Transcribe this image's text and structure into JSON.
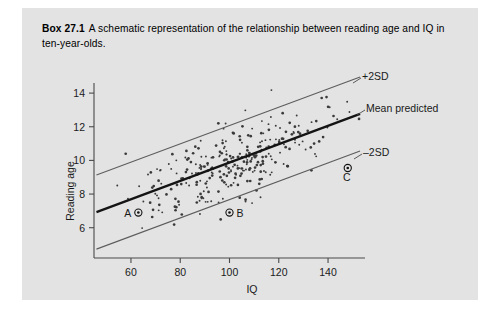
{
  "figure": {
    "box_label": "Box 27.1",
    "caption": "A schematic representation of the relationship between reading age and IQ in ten-year-olds.",
    "background_color": "#e3e3e3"
  },
  "chart_data": {
    "type": "scatter",
    "title": "",
    "xlabel": "IQ",
    "ylabel": "Reading age",
    "xlim": [
      45,
      155
    ],
    "ylim": [
      4.2,
      14.6
    ],
    "xticks": [
      60,
      80,
      100,
      120,
      140
    ],
    "yticks": [
      6,
      8,
      10,
      12,
      14
    ],
    "grid": false,
    "legend_position": "inline-right",
    "n_points": 300,
    "regression": {
      "slope": 0.0545,
      "intercept": 4.42,
      "sd": 1.1,
      "description": "mean predicted reading age = 4.42 + 0.0545 x IQ"
    },
    "lines": [
      {
        "name": "+2SD",
        "label": "+2SD",
        "offset_sd": 2,
        "style": "thin",
        "color": "#5d5d5d",
        "label_x": 362,
        "label_y": 80
      },
      {
        "name": "mean-predicted",
        "label": "Mean predicted",
        "offset_sd": 0,
        "style": "thick",
        "color": "#141414",
        "label_x": 366,
        "label_y": 112
      },
      {
        "name": "-2SD",
        "label": "–2SD",
        "offset_sd": -2,
        "style": "thin",
        "color": "#5d5d5d",
        "label_x": 363,
        "label_y": 156
      }
    ],
    "highlighted_points": [
      {
        "id": "A",
        "label": "A",
        "iq": 63,
        "reading_age": 6.9,
        "label_side": "left"
      },
      {
        "id": "B",
        "label": "B",
        "iq": 100,
        "reading_age": 6.9,
        "label_side": "right"
      },
      {
        "id": "C",
        "label": "C",
        "iq": 148,
        "reading_age": 9.55,
        "label_side": "below"
      }
    ],
    "points_seed": 20250411
  }
}
